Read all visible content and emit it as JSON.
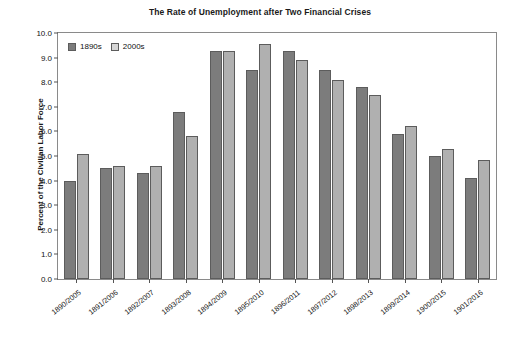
{
  "chart_data": {
    "type": "bar",
    "title": "The Rate of Unemployment after Two Financial Crises",
    "xlabel": "",
    "ylabel": "Percent of the Civilian Labor Force",
    "ylim": [
      0.0,
      10.0
    ],
    "ytick_step": 1.0,
    "ytick_labels": [
      "0.0",
      "1.0",
      "2.0",
      "3.0",
      "4.0",
      "5.0",
      "6.0",
      "7.0",
      "8.0",
      "9.0",
      "10.0"
    ],
    "ytick_values": [
      0.0,
      1.0,
      2.0,
      3.0,
      4.0,
      5.0,
      6.0,
      7.0,
      8.0,
      9.0,
      10.0
    ],
    "grid": false,
    "legend_position": "top-left-inside",
    "categories": [
      "1890/2005",
      "1891/2006",
      "1892/2007",
      "1893/2008",
      "1894/2009",
      "1895/2010",
      "1896/2011",
      "1897/2012",
      "1898/2013",
      "1899/2014",
      "1900/2015",
      "1901/2016"
    ],
    "series": [
      {
        "name": "1890s",
        "color": "#7c7c7c",
        "values": [
          4.0,
          4.5,
          4.3,
          6.8,
          9.25,
          8.5,
          9.25,
          8.5,
          7.8,
          5.9,
          5.0,
          4.1
        ]
      },
      {
        "name": "2000s",
        "color": "#b0b0b0",
        "values": [
          5.1,
          4.6,
          4.6,
          5.8,
          9.25,
          9.55,
          8.9,
          8.1,
          7.5,
          6.2,
          5.3,
          4.85
        ]
      }
    ]
  }
}
